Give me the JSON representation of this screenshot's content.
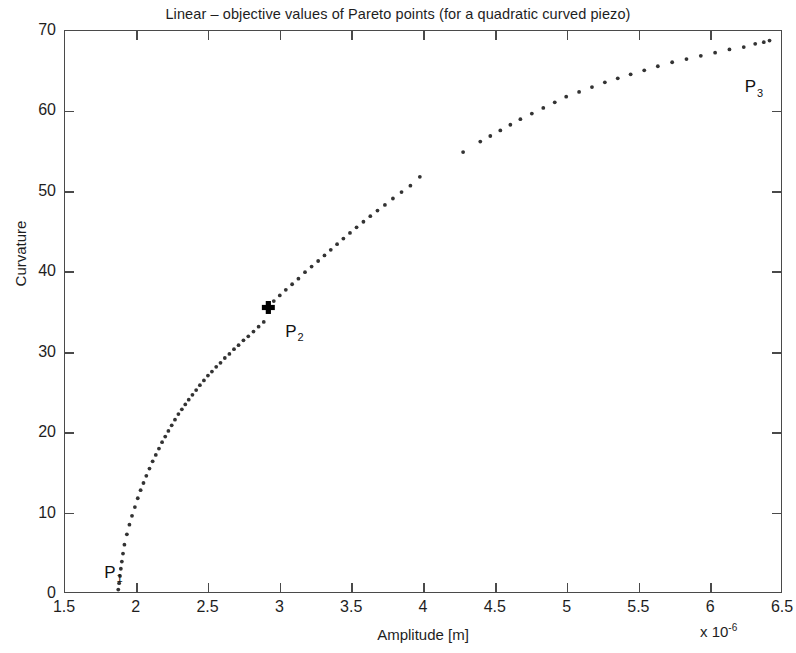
{
  "chart_data": {
    "type": "scatter",
    "title": "Linear – objective values of Pareto points (for a quadratic curved piezo)",
    "xlabel": "Amplitude [m]",
    "ylabel": "Curvature",
    "x_multiplier": "x 10",
    "x_multiplier_exponent": "-6",
    "xlim": [
      1.5,
      6.5
    ],
    "ylim": [
      0,
      70
    ],
    "xticks": [
      1.5,
      2,
      2.5,
      3,
      3.5,
      4,
      4.5,
      5,
      5.5,
      6,
      6.5
    ],
    "xticklabels": [
      "1.5",
      "2",
      "2.5",
      "3",
      "3.5",
      "4",
      "4.5",
      "5",
      "5.5",
      "6",
      "6.5"
    ],
    "yticks": [
      0,
      10,
      20,
      30,
      40,
      50,
      60,
      70
    ],
    "yticklabels": [
      "0",
      "10",
      "20",
      "30",
      "40",
      "50",
      "60",
      "70"
    ],
    "grid": false,
    "legend": null,
    "marker": "dot",
    "marker_color": "#333333",
    "axis_color": "#4a4a4a",
    "background": "#ffffff",
    "series": [
      {
        "name": "Pareto front",
        "points": [
          [
            1.872,
            0.3
          ],
          [
            1.878,
            1.1
          ],
          [
            1.884,
            2.0
          ],
          [
            1.89,
            2.9
          ],
          [
            1.897,
            3.8
          ],
          [
            1.905,
            4.8
          ],
          [
            1.915,
            5.9
          ],
          [
            1.932,
            7.2
          ],
          [
            1.95,
            8.4
          ],
          [
            1.968,
            9.5
          ],
          [
            1.988,
            10.6
          ],
          [
            2.008,
            11.7
          ],
          [
            2.028,
            12.7
          ],
          [
            2.048,
            13.6
          ],
          [
            2.068,
            14.5
          ],
          [
            2.09,
            15.4
          ],
          [
            2.112,
            16.3
          ],
          [
            2.134,
            17.1
          ],
          [
            2.156,
            17.9
          ],
          [
            2.178,
            18.7
          ],
          [
            2.2,
            19.4
          ],
          [
            2.222,
            20.1
          ],
          [
            2.245,
            20.8
          ],
          [
            2.268,
            21.5
          ],
          [
            2.292,
            22.2
          ],
          [
            2.316,
            22.8
          ],
          [
            2.34,
            23.4
          ],
          [
            2.364,
            24.0
          ],
          [
            2.39,
            24.6
          ],
          [
            2.416,
            25.2
          ],
          [
            2.442,
            25.8
          ],
          [
            2.47,
            26.4
          ],
          [
            2.498,
            27.0
          ],
          [
            2.526,
            27.5
          ],
          [
            2.556,
            28.1
          ],
          [
            2.586,
            28.6
          ],
          [
            2.616,
            29.2
          ],
          [
            2.648,
            29.7
          ],
          [
            2.68,
            30.3
          ],
          [
            2.712,
            30.8
          ],
          [
            2.746,
            31.4
          ],
          [
            2.78,
            31.9
          ],
          [
            2.816,
            32.5
          ],
          [
            2.852,
            33.1
          ],
          [
            2.888,
            33.7
          ],
          [
            2.92,
            35.5
          ],
          [
            2.958,
            36.3
          ],
          [
            3.0,
            37.0
          ],
          [
            3.042,
            37.7
          ],
          [
            3.086,
            38.4
          ],
          [
            3.13,
            39.1
          ],
          [
            3.176,
            39.9
          ],
          [
            3.222,
            40.6
          ],
          [
            3.268,
            41.3
          ],
          [
            3.312,
            42.0
          ],
          [
            3.356,
            42.7
          ],
          [
            3.4,
            43.4
          ],
          [
            3.444,
            44.1
          ],
          [
            3.49,
            44.8
          ],
          [
            3.536,
            45.5
          ],
          [
            3.584,
            46.2
          ],
          [
            3.632,
            46.9
          ],
          [
            3.682,
            47.6
          ],
          [
            3.734,
            48.3
          ],
          [
            3.79,
            49.1
          ],
          [
            3.85,
            49.9
          ],
          [
            3.912,
            50.7
          ],
          [
            3.978,
            51.8
          ],
          [
            4.28,
            54.9
          ],
          [
            4.4,
            56.2
          ],
          [
            4.47,
            56.9
          ],
          [
            4.54,
            57.6
          ],
          [
            4.61,
            58.3
          ],
          [
            4.68,
            59.0
          ],
          [
            4.76,
            59.7
          ],
          [
            4.84,
            60.4
          ],
          [
            4.92,
            61.1
          ],
          [
            5.0,
            61.8
          ],
          [
            5.09,
            62.4
          ],
          [
            5.18,
            63.0
          ],
          [
            5.27,
            63.6
          ],
          [
            5.36,
            64.1
          ],
          [
            5.45,
            64.6
          ],
          [
            5.545,
            65.1
          ],
          [
            5.64,
            65.6
          ],
          [
            5.74,
            66.1
          ],
          [
            5.84,
            66.5
          ],
          [
            5.94,
            66.9
          ],
          [
            6.04,
            67.3
          ],
          [
            6.14,
            67.7
          ],
          [
            6.24,
            68.0
          ],
          [
            6.32,
            68.4
          ],
          [
            6.38,
            68.6
          ],
          [
            6.42,
            68.8
          ]
        ]
      }
    ],
    "highlighted_points": [
      {
        "label": "P",
        "subscript": "2",
        "x": 2.92,
        "y": 35.5,
        "marker": "bold-cross"
      }
    ],
    "annotations": [
      {
        "label": "P",
        "subscript": "1",
        "x": 1.78,
        "y": 3.6
      },
      {
        "label": "P",
        "subscript": "2",
        "x": 3.04,
        "y": 33.6
      },
      {
        "label": "P",
        "subscript": "3",
        "x": 6.24,
        "y": 64.0
      }
    ]
  }
}
